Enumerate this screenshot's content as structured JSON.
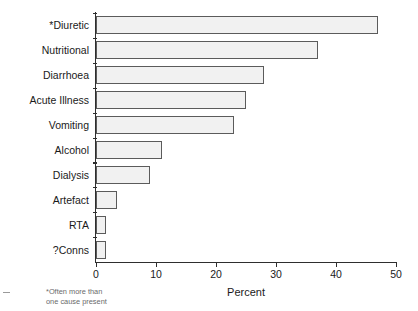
{
  "chart_data": {
    "type": "bar",
    "orientation": "horizontal",
    "title": "",
    "xlabel": "Percent",
    "ylabel": "",
    "xlim": [
      0,
      50
    ],
    "xticks": [
      0,
      10,
      20,
      30,
      40,
      50
    ],
    "grid": false,
    "legend": null,
    "categories": [
      "*Diuretic",
      "Nutritional",
      "Diarrhoea",
      "Acute Illness",
      "Vomiting",
      "Alcohol",
      "Dialysis",
      "Artefact",
      "RTA",
      "?Conns"
    ],
    "values": [
      47,
      37,
      28,
      25,
      23,
      11,
      9,
      3.5,
      1.7,
      1.7
    ],
    "annotations": [
      "*Often more than\none cause present"
    ],
    "colors": {
      "bar_fill": "#f1f1f1",
      "bar_border": "#5b5b5b",
      "axis": "#2e2e2e",
      "text": "#1a1a1a",
      "footnote_text": "#6a6a6a",
      "background": "#ffffff"
    }
  },
  "footnote": {
    "text": "*Often more than\none cause present"
  },
  "axis": {
    "x_title": "Percent",
    "tick_labels": [
      "0",
      "10",
      "20",
      "30",
      "40",
      "50"
    ]
  }
}
